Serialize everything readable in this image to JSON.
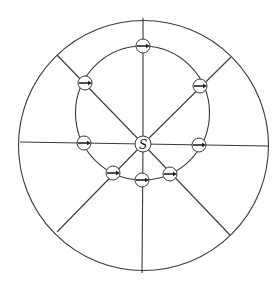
{
  "diagram": {
    "title": "",
    "center_label": "S",
    "outer_circle": {
      "cx": 143.5,
      "cy": 145.5,
      "r": 125
    },
    "inner_circle": {
      "cx": 142.5,
      "cy": 113,
      "r": 67
    },
    "source": {
      "cx": 143,
      "cy": 144,
      "r": 8,
      "label": "S"
    },
    "radial_lines": [
      {
        "name": "up",
        "x2": 143,
        "y2": 18
      },
      {
        "name": "up-right",
        "x2": 231,
        "y2": 57
      },
      {
        "name": "right",
        "x2": 268,
        "y2": 146
      },
      {
        "name": "down-right",
        "x2": 230,
        "y2": 235
      },
      {
        "name": "down",
        "x2": 142,
        "y2": 273
      },
      {
        "name": "down-left",
        "x2": 57,
        "y2": 232
      },
      {
        "name": "left",
        "x2": 20,
        "y2": 142
      },
      {
        "name": "up-left",
        "x2": 57,
        "y2": 55
      }
    ],
    "markers": [
      {
        "name": "top",
        "cx": 143,
        "cy": 46,
        "r": 7,
        "arrow": "right"
      },
      {
        "name": "upper-right",
        "cx": 200,
        "cy": 86,
        "r": 7,
        "arrow": "right"
      },
      {
        "name": "right",
        "cx": 199,
        "cy": 145,
        "r": 7,
        "arrow": "right"
      },
      {
        "name": "lower-right",
        "cx": 170,
        "cy": 174,
        "r": 7,
        "arrow": "right"
      },
      {
        "name": "bottom",
        "cx": 142,
        "cy": 180,
        "r": 7,
        "arrow": "right"
      },
      {
        "name": "lower-left",
        "cx": 113,
        "cy": 173,
        "r": 7,
        "arrow": "right"
      },
      {
        "name": "left",
        "cx": 84,
        "cy": 143,
        "r": 7,
        "arrow": "right"
      },
      {
        "name": "upper-left",
        "cx": 85,
        "cy": 83,
        "r": 7,
        "arrow": "right"
      }
    ]
  }
}
